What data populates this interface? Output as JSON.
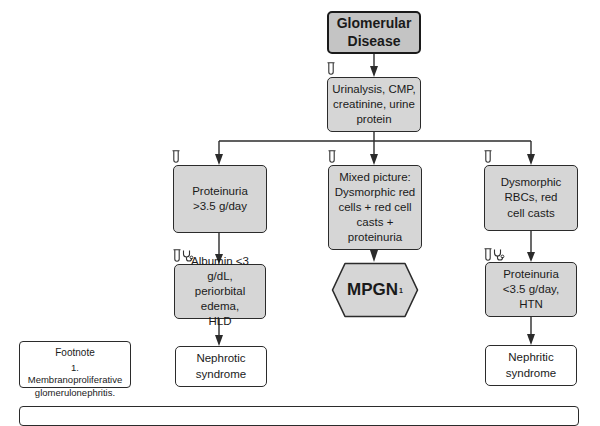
{
  "diagram": {
    "title": "Glomerular Disease",
    "start_node": {
      "line1": "Glomerular",
      "line2": "Disease"
    },
    "workup_node": {
      "line1": "Urinalysis, CMP,",
      "line2": "creatinine, urine",
      "line3": "protein"
    },
    "branches": [
      {
        "finding": {
          "line1": "Proteinuria",
          "line2": ">3.5 g/day"
        },
        "criteria": {
          "line1": "Albumin <3 g/dL,",
          "line2": "periorbital edema,",
          "line3": "HLD"
        },
        "outcome": {
          "line1": "Nephrotic",
          "line2": "syndrome"
        },
        "icons": [
          "test-tube",
          "stethoscope"
        ]
      },
      {
        "finding": {
          "line1": "Mixed picture:",
          "line2": "Dysmorphic red",
          "line3": "cells + red cell",
          "line4": "casts + proteinuria"
        },
        "outcome": {
          "label": "MPGN",
          "footnote_ref": "1"
        },
        "icons": [
          "test-tube"
        ]
      },
      {
        "finding": {
          "line1": "Dysmorphic",
          "line2": "RBCs, red",
          "line3": "cell casts"
        },
        "criteria": {
          "line1": "Proteinuria",
          "line2": "<3.5 g/day,",
          "line3": "HTN"
        },
        "outcome": {
          "line1": "Nephritic",
          "line2": "syndrome"
        },
        "icons": [
          "test-tube",
          "stethoscope"
        ]
      }
    ],
    "footnote": {
      "title": "Footnote",
      "line1": "1. Membranoproliferative",
      "line2": "glomerulonephritis."
    }
  },
  "colors": {
    "gray_fill": "#d6d6d6",
    "start_fill": "#c4c4c4",
    "border": "#2b2b2b",
    "white": "#ffffff"
  }
}
